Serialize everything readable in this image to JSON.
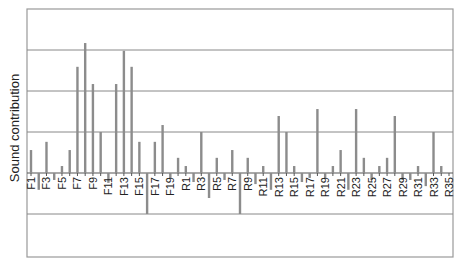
{
  "chart_data": {
    "type": "bar",
    "title": "",
    "xlabel": "",
    "ylabel": "Sound contribution",
    "ylim": [
      -2.0,
      4.0
    ],
    "grid": true,
    "legend": null,
    "colors": {
      "bar": "#8c8c8c",
      "grid": "#888888",
      "frame": "#999999",
      "text": "#222222"
    },
    "categories": [
      "F1",
      "F2",
      "F3",
      "F4",
      "F5",
      "F6",
      "F7",
      "F8",
      "F9",
      "F10",
      "F11",
      "F12",
      "F13",
      "F14",
      "F15",
      "F16",
      "F17",
      "F18",
      "F19",
      "F20",
      "R1",
      "R2",
      "R3",
      "R4",
      "R5",
      "R6",
      "R7",
      "R8",
      "R9",
      "R10",
      "R11",
      "R12",
      "R13",
      "R14",
      "R15",
      "R16",
      "R17",
      "R18",
      "R19",
      "R20",
      "R21",
      "R22",
      "R23",
      "R24",
      "R25",
      "R26",
      "R27",
      "R28",
      "R29",
      "R30",
      "R31",
      "R32",
      "R33",
      "R34",
      "R35"
    ],
    "visible_tick_labels": [
      "F1",
      "F3",
      "F5",
      "F7",
      "F9",
      "F11",
      "F13",
      "F15",
      "F17",
      "F19",
      "R1",
      "R3",
      "R5",
      "R7",
      "R9",
      "R11",
      "R13",
      "R15",
      "R17",
      "R19",
      "R21",
      "R23",
      "R25",
      "R27",
      "R29",
      "R31",
      "R33",
      "R35"
    ],
    "values": [
      0.56,
      -0.41,
      0.76,
      -0.17,
      0.17,
      0.56,
      2.59,
      3.17,
      2.17,
      1.0,
      -0.24,
      2.17,
      2.98,
      2.59,
      0.76,
      -1.0,
      0.76,
      1.17,
      -0.12,
      0.37,
      0.17,
      -0.22,
      1.0,
      -0.61,
      0.37,
      -0.17,
      0.56,
      -1.0,
      0.37,
      -0.27,
      0.17,
      -0.41,
      1.39,
      1.0,
      0.17,
      -0.22,
      -0.12,
      1.56,
      -0.12,
      0.17,
      0.56,
      -0.41,
      1.56,
      0.37,
      -0.17,
      0.17,
      0.37,
      1.39,
      -0.17,
      -0.17,
      0.17,
      -0.32,
      1.0,
      0.17,
      0.0
    ],
    "gridlines": [
      -1,
      1,
      2,
      3
    ]
  }
}
